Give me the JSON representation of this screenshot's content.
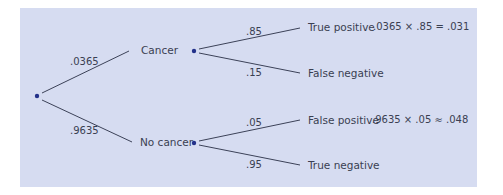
{
  "colors": {
    "panel_background": "#d6dcf1",
    "line": "#3c4258",
    "node": "#23318a",
    "text": "#3a3f52"
  },
  "tree": {
    "root": {
      "branches": [
        {
          "probability": ".0365",
          "label": "Cancer",
          "branches": [
            {
              "probability": ".85",
              "label": "True positive",
              "equation": ".0365 × .85 = .031"
            },
            {
              "probability": ".15",
              "label": "False negative",
              "equation": ""
            }
          ]
        },
        {
          "probability": ".9635",
          "label": "No cancer",
          "branches": [
            {
              "probability": ".05",
              "label": "False positive",
              "equation": ".9635 × .05 ≈ .048"
            },
            {
              "probability": ".95",
              "label": "True negative",
              "equation": ""
            }
          ]
        }
      ]
    }
  }
}
